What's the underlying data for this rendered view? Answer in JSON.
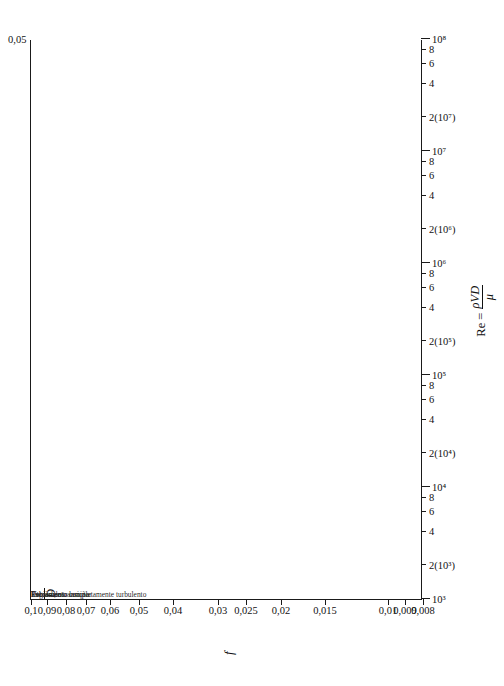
{
  "chart_data": {
    "type": "line",
    "xlabel": "Re = ρVD/μ",
    "ylabel": "f",
    "xscale": "log",
    "yscale": "log",
    "xlim": [
      1000,
      100000000
    ],
    "ylim": [
      0.008,
      0.1
    ],
    "grid": false,
    "legend_position": "none",
    "y_ticks": [
      "0,1",
      "0,09",
      "0,08",
      "0,07",
      "0,06",
      "0,05",
      "0,04",
      "0,03",
      "0,025",
      "0,02",
      "0,015",
      "0,01",
      "0,009",
      "0,008"
    ],
    "y_tick_values": [
      0.1,
      0.09,
      0.08,
      0.07,
      0.06,
      0.05,
      0.04,
      0.03,
      0.025,
      0.02,
      0.015,
      0.01,
      0.009,
      0.008
    ],
    "x_ticks": [
      "10³",
      "2(10³)",
      "4",
      "6",
      "8",
      "10⁴",
      "2(10⁴)",
      "4",
      "6",
      "8",
      "10⁵",
      "2(10⁵)",
      "4",
      "6",
      "8",
      "10⁶",
      "2(10⁶)",
      "4",
      "6",
      "8",
      "10⁷",
      "2(10⁷)",
      "4",
      "6",
      "8",
      "10⁸"
    ],
    "x_tick_values": [
      1000,
      2000,
      4000,
      6000,
      8000,
      10000,
      20000,
      40000,
      60000,
      80000,
      100000,
      200000,
      400000,
      600000,
      800000,
      1000000,
      2000000,
      4000000,
      6000000,
      8000000,
      10000000,
      20000000,
      40000000,
      60000000,
      80000000,
      100000000
    ],
    "relative_roughness_label": "ε/D",
    "relative_roughness_labels": [
      "0,05",
      "0,04",
      "0,03",
      "0,02",
      "0,015",
      "0,01",
      "0,008",
      "0,006",
      "0,004",
      "0,002",
      "0,001",
      "0,0006",
      "0,0004",
      "0,0002",
      "0,0001",
      "0,00005",
      "0,00001"
    ],
    "relative_roughness_values": [
      0.05,
      0.04,
      0.03,
      0.02,
      0.015,
      0.01,
      0.008,
      0.006,
      0.004,
      0.002,
      0.001,
      0.0006,
      0.0004,
      0.0002,
      0.0001,
      5e-05,
      1e-05
    ],
    "fully_rough_f": [
      0.0716,
      0.0652,
      0.0573,
      0.049,
      0.0442,
      0.0379,
      0.0353,
      0.0324,
      0.0283,
      0.0234,
      0.0196,
      0.0177,
      0.0165,
      0.0142,
      0.0124,
      0.0115,
      0.009
    ],
    "annotations": [
      {
        "text": "Escoamento laminar",
        "x": 2000,
        "y": 0.0165
      },
      {
        "text": "Região de transição",
        "x": 3300,
        "y": 0.0155
      },
      {
        "text": "Escoamento completamente turbulento",
        "x": 22000,
        "y": 0.062
      },
      {
        "text": "Tubos lisos",
        "x": 150000,
        "y": 0.0175
      }
    ],
    "laminar_line": {
      "label": "Escoamento laminar",
      "formula": "f = 64/Re",
      "re_from": 1000,
      "re_to": 2300
    },
    "series": [
      {
        "name": "Tubos lisos",
        "style": "solid"
      },
      {
        "name": "Escoamento completamente turbulento",
        "style": "dashed"
      }
    ],
    "accent_color": "#1a1a1a",
    "background_color": "#ffffff"
  },
  "axes": {
    "y_title": "f",
    "x_title_prefix": "Re = ",
    "x_title_num": "ρVD",
    "x_title_den": "μ",
    "eps_title_num": "ε",
    "eps_title_den": "D"
  },
  "annotations": {
    "laminar": "Escoamento laminar",
    "transition": "Região de transição",
    "fully_turbulent": "Escoamento completamente turbulento",
    "smooth_pipes": "Tubos lisos"
  }
}
